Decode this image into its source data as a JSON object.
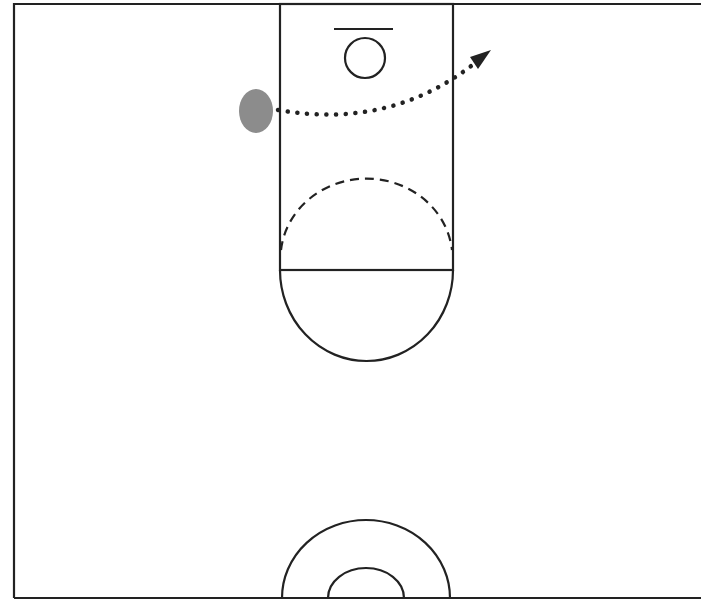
{
  "diagram": {
    "type": "basketball-half-court-play",
    "colors": {
      "background": "#ffffff",
      "line": "#222222",
      "player": "#8c8c8c",
      "path": "#222222"
    },
    "court": {
      "left": 14,
      "top": 4,
      "right": 701,
      "bottom": 598,
      "lane": {
        "x1": 280,
        "x2": 453,
        "top": 4,
        "free_throw_y": 270
      },
      "backboard": {
        "x1": 334,
        "x2": 393,
        "y": 29
      },
      "rim": {
        "cx": 365,
        "cy": 58,
        "r": 20
      },
      "free_throw_circle": {
        "cx": 366,
        "cy": 270,
        "r": 88,
        "top_half": "dashed",
        "bottom_half": "solid"
      },
      "center_circle": {
        "cx": 366,
        "cy": 598,
        "outer_r": 84,
        "inner_r": 38
      }
    },
    "player": {
      "cx": 256,
      "cy": 111,
      "rx": 17,
      "ry": 22,
      "label": ""
    },
    "movement_path": {
      "style": "dotted-arrow",
      "start": [
        278,
        110
      ],
      "control": [
        380,
        130
      ],
      "end": [
        490,
        52
      ]
    }
  }
}
